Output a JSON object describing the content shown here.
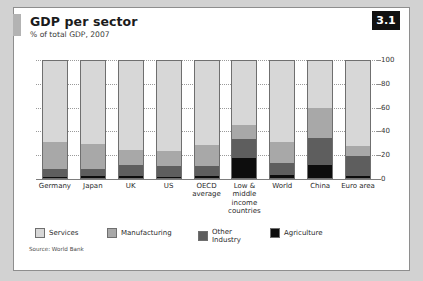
{
  "badge": {
    "label": "3.1"
  },
  "header": {
    "title": "GDP per sector",
    "subtitle": "% of total GDP, 2007"
  },
  "source": "Source: World Bank",
  "colors": {
    "services": "#d7d7d7",
    "manufacturing": "#a8a8a8",
    "other_industry": "#5e5e5e",
    "agriculture": "#0d0d0d",
    "badge_bg": "#111111",
    "accent": "#b3b3b3"
  },
  "legend": [
    {
      "label": "Services",
      "color": "#d7d7d7"
    },
    {
      "label": "Manufacturing",
      "color": "#a8a8a8"
    },
    {
      "label": "Other Industry",
      "color": "#5e5e5e"
    },
    {
      "label": "Agriculture",
      "color": "#0d0d0d"
    }
  ],
  "chart_data": {
    "type": "bar",
    "title": "GDP per sector",
    "subtitle": "% of total GDP, 2007",
    "xlabel": "",
    "ylabel": "",
    "ylim": [
      0,
      100
    ],
    "yticks": [
      0,
      20,
      40,
      60,
      80,
      100
    ],
    "grid": true,
    "stacked": true,
    "legend_position": "bottom",
    "axis_side": "right",
    "categories": [
      "Germany",
      "Japan",
      "UK",
      "US",
      "OECD average",
      "Low & middle income countries",
      "World",
      "China",
      "Euro area"
    ],
    "series": [
      {
        "name": "Services",
        "values": [
          69,
          71,
          76,
          77,
          72,
          55,
          69,
          40,
          73
        ]
      },
      {
        "name": "Manufacturing",
        "values": [
          23,
          21,
          13,
          13,
          18,
          12,
          18,
          26,
          8
        ]
      },
      {
        "name": "Other Industry",
        "values": [
          7,
          6,
          9,
          9,
          8,
          16,
          10,
          23,
          17
        ]
      },
      {
        "name": "Agriculture",
        "values": [
          1,
          2,
          2,
          1,
          2,
          17,
          3,
          11,
          2
        ]
      }
    ]
  }
}
